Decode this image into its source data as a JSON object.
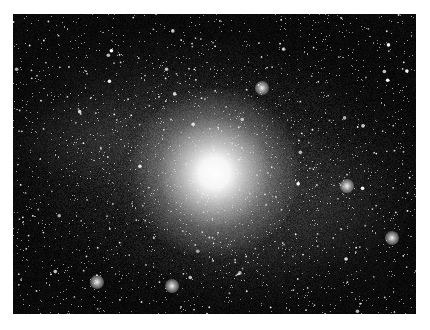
{
  "image": {
    "subject": "spiral galaxy",
    "alt": "Grayscale astronomical photograph of a face-on spiral galaxy with a bright white core, mottled spiral arms, and a dense background star field",
    "colors": {
      "background": "#ffffff",
      "sky": "#0b0b0b",
      "core": "#ffffff",
      "arms": "#9a9a9a"
    },
    "bright_regions": [
      {
        "name": "core",
        "x": 215,
        "y": 170
      },
      {
        "name": "hii-region-upper-right",
        "x": 262,
        "y": 88
      },
      {
        "name": "hii-region-right",
        "x": 347,
        "y": 186
      },
      {
        "name": "hii-region-lower-right",
        "x": 392,
        "y": 238
      },
      {
        "name": "hii-region-bottom",
        "x": 172,
        "y": 286
      },
      {
        "name": "hii-region-lower-left",
        "x": 97,
        "y": 282
      }
    ]
  }
}
